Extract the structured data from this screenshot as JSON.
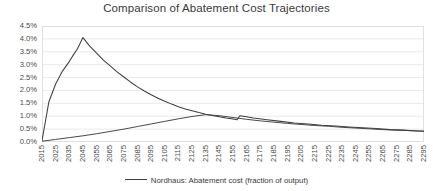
{
  "chart_data": {
    "type": "line",
    "title": "Comparison of Abatement Cost Trajectories",
    "xlabel": "",
    "ylabel": "",
    "xlim": [
      2015,
      2295
    ],
    "ylim": [
      0.0,
      4.5
    ],
    "y_tick_labels": [
      "4.5%",
      "4.0%",
      "3.5%",
      "3.0%",
      "2.5%",
      "2.0%",
      "1.5%",
      "1.0%",
      "0.5%",
      "0.0%"
    ],
    "y_tick_values": [
      4.5,
      4.0,
      3.5,
      3.0,
      2.5,
      2.0,
      1.5,
      1.0,
      0.5,
      0.0
    ],
    "x_tick_labels": [
      "2015",
      "2025",
      "2035",
      "2045",
      "2055",
      "2065",
      "2075",
      "2085",
      "2095",
      "2105",
      "2115",
      "2125",
      "2135",
      "2145",
      "2155",
      "2165",
      "2175",
      "2185",
      "2195",
      "2205",
      "2215",
      "2225",
      "2235",
      "2245",
      "2255",
      "2265",
      "2275",
      "2285",
      "2295"
    ],
    "grid": "horizontal",
    "legend_position": "bottom",
    "line_color": "#3f3f3f",
    "series": [
      {
        "name": "Nordhaus: Abatement cost (fraction of output)",
        "x": [
          2015,
          2020,
          2025,
          2030,
          2035,
          2038,
          2041,
          2045,
          2050,
          2055,
          2060,
          2065,
          2070,
          2075,
          2080,
          2085,
          2090,
          2095,
          2100,
          2105,
          2110,
          2115,
          2120,
          2125,
          2130,
          2135,
          2140,
          2145,
          2150,
          2155,
          2158,
          2160,
          2165,
          2170,
          2180,
          2190,
          2200,
          2210,
          2220,
          2230,
          2240,
          2250,
          2260,
          2270,
          2280,
          2290,
          2295
        ],
        "values": [
          0.05,
          1.55,
          2.25,
          2.75,
          3.12,
          3.38,
          3.62,
          4.05,
          3.72,
          3.45,
          3.18,
          2.95,
          2.72,
          2.52,
          2.32,
          2.14,
          1.98,
          1.83,
          1.7,
          1.58,
          1.47,
          1.37,
          1.28,
          1.21,
          1.14,
          1.08,
          1.03,
          0.98,
          0.93,
          0.89,
          0.86,
          1.02,
          0.98,
          0.93,
          0.86,
          0.8,
          0.74,
          0.7,
          0.65,
          0.62,
          0.58,
          0.55,
          0.52,
          0.48,
          0.46,
          0.43,
          0.42
        ]
      },
      {
        "name": "Rising trajectory",
        "x": [
          2015,
          2025,
          2035,
          2045,
          2055,
          2065,
          2075,
          2085,
          2095,
          2105,
          2115,
          2125,
          2135,
          2145,
          2155,
          2165,
          2175,
          2185,
          2195,
          2205,
          2215,
          2225,
          2235,
          2245,
          2255,
          2265,
          2275,
          2285,
          2295
        ],
        "values": [
          0.03,
          0.1,
          0.17,
          0.24,
          0.32,
          0.41,
          0.5,
          0.6,
          0.7,
          0.8,
          0.9,
          0.99,
          1.06,
          1.02,
          0.95,
          0.88,
          0.82,
          0.77,
          0.72,
          0.68,
          0.64,
          0.61,
          0.57,
          0.54,
          0.51,
          0.48,
          0.46,
          0.44,
          0.42
        ]
      }
    ]
  },
  "legend": {
    "entries": [
      {
        "label": "Nordhaus: Abatement cost (fraction of output)",
        "marker": "line-swatch"
      }
    ]
  }
}
